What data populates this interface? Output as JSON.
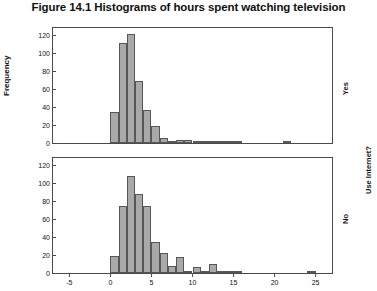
{
  "figure": {
    "title": "Figure 14.1 Histograms of hours spent watching television",
    "y_axis_label": "Frequency",
    "group_label": "Use Internet?",
    "panel_yes_label": "Yes",
    "panel_no_label": "No"
  },
  "chart_data": {
    "type": "bar",
    "title": "Figure 14.1 Histograms of hours spent watching television",
    "subtitle": "",
    "xlabel": "",
    "ylabel": "Frequency",
    "grid": false,
    "legend_position": "right",
    "xlim": [
      -7,
      27
    ],
    "ylim": [
      0,
      128
    ],
    "xticks": [
      -5,
      0,
      5,
      10,
      15,
      20,
      25
    ],
    "yticks": [
      0,
      20,
      40,
      60,
      80,
      100,
      120
    ],
    "panels": [
      {
        "name": "Yes",
        "group_label": "Use Internet?",
        "bin_width": 1,
        "x": [
          0,
          1,
          2,
          3,
          4,
          5,
          6,
          7,
          8,
          9,
          10,
          11,
          12,
          13,
          14,
          15,
          16,
          20,
          21
        ],
        "values": [
          34,
          111,
          121,
          69,
          37,
          19,
          6,
          2,
          3,
          3,
          1,
          2,
          2,
          1,
          1,
          2,
          0,
          0,
          1
        ]
      },
      {
        "name": "No",
        "group_label": "Use Internet?",
        "bin_width": 1,
        "x": [
          0,
          1,
          2,
          3,
          4,
          5,
          6,
          7,
          8,
          9,
          10,
          11,
          12,
          13,
          14,
          15,
          16,
          23,
          24
        ],
        "values": [
          19,
          75,
          108,
          88,
          75,
          34,
          22,
          8,
          18,
          1,
          7,
          1,
          10,
          1,
          1,
          1,
          0,
          0,
          1
        ]
      }
    ]
  },
  "style": {
    "bar_fill": "#a9a9a9",
    "bar_border": "#575757",
    "frame_color": "#4a4a4a",
    "text_color": "#111111",
    "background": "#ffffff"
  }
}
